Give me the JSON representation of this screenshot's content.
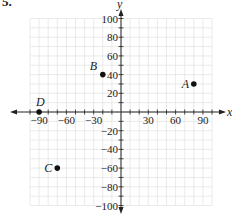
{
  "problem": {
    "number": "5."
  },
  "axes": {
    "x_label": "x",
    "y_label": "y",
    "x_ticks": [
      {
        "value": -90,
        "label": "−90"
      },
      {
        "value": -60,
        "label": "−60"
      },
      {
        "value": -30,
        "label": "−30"
      },
      {
        "value": 30,
        "label": "30"
      },
      {
        "value": 60,
        "label": "60"
      },
      {
        "value": 90,
        "label": "90"
      }
    ],
    "y_ticks": [
      {
        "value": 100,
        "label": "100"
      },
      {
        "value": 80,
        "label": "80"
      },
      {
        "value": 60,
        "label": "60"
      },
      {
        "value": 40,
        "label": "40"
      },
      {
        "value": 20,
        "label": "20"
      },
      {
        "value": -20,
        "label": "−20"
      },
      {
        "value": -40,
        "label": "−40"
      },
      {
        "value": -60,
        "label": "−60"
      },
      {
        "value": -80,
        "label": "−80"
      },
      {
        "value": -100,
        "label": "−100"
      }
    ],
    "x_range": [
      -100,
      100
    ],
    "y_range": [
      -100,
      100
    ]
  },
  "points": [
    {
      "label": "A",
      "x": 80,
      "y": 30
    },
    {
      "label": "B",
      "x": -20,
      "y": 40
    },
    {
      "label": "C",
      "x": -70,
      "y": -60
    },
    {
      "label": "D",
      "x": -90,
      "y": 0
    }
  ],
  "colors": {
    "grid": "#e4e4e4",
    "axis": "#222222",
    "point": "#111111"
  }
}
